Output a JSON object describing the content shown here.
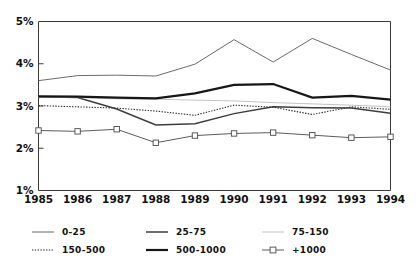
{
  "chart_data": {
    "type": "line",
    "title": "",
    "xlabel": "",
    "ylabel": "",
    "x": [
      1985,
      1986,
      1987,
      1988,
      1989,
      1990,
      1991,
      1992,
      1993,
      1994
    ],
    "xtick_labels": [
      "1985",
      "1986",
      "1987",
      "1988",
      "1989",
      "1990",
      "1991",
      "1992",
      "1993",
      "1994"
    ],
    "ytick_labels": [
      "1%",
      "2%",
      "3%",
      "4%",
      "5%"
    ],
    "yticks": [
      1,
      2,
      3,
      4,
      5
    ],
    "ylim": [
      1,
      5
    ],
    "xlim": [
      1985,
      1994
    ],
    "grid": false,
    "legend_position": "below-axes",
    "series": [
      {
        "name": "0-25",
        "style": "solid-thin",
        "color": "#5a5a5a",
        "marker": "none",
        "values": [
          3.6,
          3.72,
          3.73,
          3.71,
          3.99,
          4.57,
          4.04,
          4.6,
          4.22,
          3.85
        ]
      },
      {
        "name": "25-75",
        "style": "solid-medium",
        "color": "#3d3d3d",
        "marker": "none",
        "values": [
          3.22,
          3.2,
          2.93,
          2.55,
          2.58,
          2.82,
          2.98,
          2.96,
          2.95,
          2.83
        ]
      },
      {
        "name": "75-150",
        "style": "solid-faint",
        "color": "#b4b4b4",
        "marker": "none",
        "values": [
          3.2,
          3.2,
          3.17,
          3.16,
          3.14,
          3.12,
          3.08,
          3.05,
          3.02,
          2.98
        ]
      },
      {
        "name": "150-500",
        "style": "dotted",
        "color": "#2e2e2e",
        "marker": "none",
        "values": [
          3.01,
          2.98,
          2.95,
          2.88,
          2.78,
          3.02,
          2.97,
          2.8,
          2.98,
          2.92
        ]
      },
      {
        "name": "500-1000",
        "style": "solid-thick",
        "color": "#161616",
        "marker": "none",
        "values": [
          3.23,
          3.22,
          3.2,
          3.18,
          3.3,
          3.5,
          3.52,
          3.2,
          3.24,
          3.15
        ]
      },
      {
        "name": "+1000",
        "style": "solid-marker",
        "color": "#4a4a4a",
        "marker": "square",
        "values": [
          2.42,
          2.4,
          2.45,
          2.13,
          2.3,
          2.35,
          2.37,
          2.31,
          2.25,
          2.27
        ]
      }
    ],
    "legend": [
      {
        "label": "0-25",
        "style": "solid-thin",
        "marker": "none"
      },
      {
        "label": "25-75",
        "style": "solid-medium",
        "marker": "none"
      },
      {
        "label": "75-150",
        "style": "solid-faint",
        "marker": "none"
      },
      {
        "label": "150-500",
        "style": "dotted",
        "marker": "none"
      },
      {
        "label": "500-1000",
        "style": "solid-thick",
        "marker": "none"
      },
      {
        "label": "+1000",
        "style": "solid-marker",
        "marker": "square"
      }
    ]
  }
}
